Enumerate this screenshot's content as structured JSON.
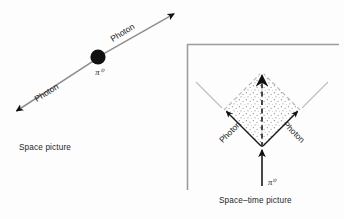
{
  "figure": {
    "background_color": "#fdfdfd",
    "ink_color": "#1a1a1a",
    "light_line_color": "#b5b5b5",
    "stipple_color": "#8a8a8a"
  },
  "space_picture": {
    "caption": "Space picture",
    "particle_label": "π⁰",
    "photon_label_left": "Photon",
    "photon_label_right": "Photon",
    "vertex_dot": {
      "cx": 98,
      "cy": 57,
      "r": 7.6
    },
    "track_line": {
      "x1": 14,
      "y1": 113,
      "x2": 176,
      "y2": 12
    },
    "arrow_left_tip": {
      "x": 14,
      "y": 113
    },
    "arrow_right_tip": {
      "x": 176,
      "y": 12
    },
    "label_left_pos": {
      "x": 48,
      "y": 96,
      "rotate": -32
    },
    "label_right_pos": {
      "x": 124,
      "y": 35,
      "rotate": -32
    },
    "particle_label_pos": {
      "x": 99,
      "y": 74
    }
  },
  "spacetime_picture": {
    "caption": "Space–time picture",
    "particle_label": "π⁰",
    "photon_label_left": "Photon",
    "photon_label_right": "Photon",
    "frame": {
      "left": 187,
      "top": 44,
      "right": 339,
      "bottom": 190
    },
    "diamond": {
      "bottom": {
        "x": 262,
        "y": 147
      },
      "left": {
        "x": 224,
        "y": 110
      },
      "right": {
        "x": 300,
        "y": 110
      },
      "top": {
        "x": 262,
        "y": 72
      }
    },
    "incoming_arrow": {
      "x1": 262,
      "y1": 185,
      "x2": 262,
      "y2": 147
    },
    "center_dashed_arrow": {
      "x1": 262,
      "y1": 147,
      "x2": 262,
      "y2": 70
    },
    "light_cone_extension_left": {
      "x1": 224,
      "y1": 110,
      "x2": 196,
      "y2": 82
    },
    "light_cone_extension_right": {
      "x1": 300,
      "y1": 110,
      "x2": 328,
      "y2": 82
    },
    "label_left_pos": {
      "x": 231,
      "y": 133,
      "rotate": -45
    },
    "label_right_pos": {
      "x": 282,
      "y": 133,
      "rotate": 45
    },
    "particle_label_pos": {
      "x": 270,
      "y": 184
    }
  }
}
